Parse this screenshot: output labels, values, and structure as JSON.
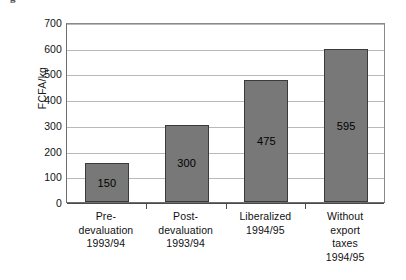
{
  "chart_data": {
    "type": "bar",
    "title": "",
    "xlabel": "",
    "ylabel": "FCFA/kg",
    "ylim": [
      0,
      700
    ],
    "ytick_step": 100,
    "yticks": [
      700,
      600,
      500,
      400,
      300,
      200,
      100,
      0
    ],
    "grid": true,
    "legend": "none",
    "categories": [
      "Pre-devaluation 1993/94",
      "Post-devaluation 1993/94",
      "Liberalized 1994/95",
      "Without export taxes 1994/95"
    ],
    "category_lines": [
      [
        "Pre-",
        "devaluation",
        "1993/94"
      ],
      [
        "Post-",
        "devaluation",
        "1993/94"
      ],
      [
        "Liberalized",
        "1994/95"
      ],
      [
        "Without",
        "export",
        "taxes",
        "1994/95"
      ]
    ],
    "values": [
      150,
      300,
      475,
      595
    ],
    "value_labels": [
      "150",
      "300",
      "475",
      "595"
    ],
    "bar_color": "#787878",
    "bar_edge_color": "#3b3b3b",
    "gridline_color": "#b9b9b9",
    "axis_color": "#4a4a4a",
    "text_color": "#111111"
  },
  "caption": {
    "cut_glyph": "g"
  }
}
